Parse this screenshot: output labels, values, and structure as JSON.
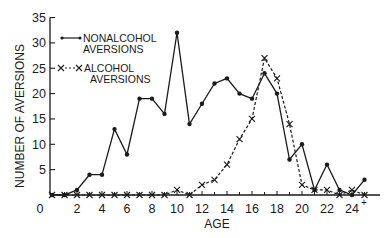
{
  "chart_data": {
    "type": "line",
    "title": "",
    "xlabel": "AGE",
    "ylabel": "NUMBER OF AVERSIONS",
    "x": [
      0,
      1,
      2,
      3,
      4,
      5,
      6,
      7,
      8,
      9,
      10,
      11,
      12,
      13,
      14,
      15,
      16,
      17,
      18,
      19,
      20,
      21,
      22,
      23,
      24,
      25
    ],
    "x_tick_labels": [
      "0",
      "2",
      "4",
      "6",
      "8",
      "10",
      "12",
      "14",
      "16",
      "18",
      "20",
      "22",
      "24+"
    ],
    "x_tick_positions": [
      0,
      2,
      4,
      6,
      8,
      10,
      12,
      14,
      16,
      18,
      20,
      22,
      24
    ],
    "y_ticks": [
      5,
      10,
      15,
      20,
      25,
      30,
      35
    ],
    "y_tick_labels": [
      "0",
      "5",
      "10",
      "15",
      "20",
      "25",
      "30",
      "35"
    ],
    "ylim": [
      0,
      35
    ],
    "xlim": [
      0,
      26
    ],
    "grid": false,
    "legend_position": "upper-left",
    "series": [
      {
        "name": "NONALCOHOL AVERSIONS",
        "style": "solid line with dot markers",
        "values": [
          0,
          0,
          1,
          4,
          4,
          13,
          8,
          19,
          19,
          16,
          32,
          14,
          18,
          22,
          23,
          20,
          19,
          24,
          20,
          7,
          10,
          1,
          6,
          1,
          0,
          3
        ]
      },
      {
        "name": "ALCOHOL AVERSIONS",
        "style": "dashed line with x markers",
        "values": [
          0,
          0,
          0,
          0,
          0,
          0,
          0,
          0,
          0,
          0,
          1,
          0,
          2,
          3,
          6,
          11,
          15,
          27,
          23,
          14,
          2,
          1,
          1,
          0,
          1,
          0
        ]
      }
    ]
  },
  "legend": {
    "nonalcohol_line1": "NONALCOHOL",
    "nonalcohol_line2": "AVERSIONS",
    "alcohol_line1": "ALCOHOL",
    "alcohol_line2": "AVERSIONS"
  },
  "axes": {
    "xlabel": "AGE",
    "ylabel": "NUMBER OF AVERSIONS",
    "x_zero_label": "0"
  }
}
